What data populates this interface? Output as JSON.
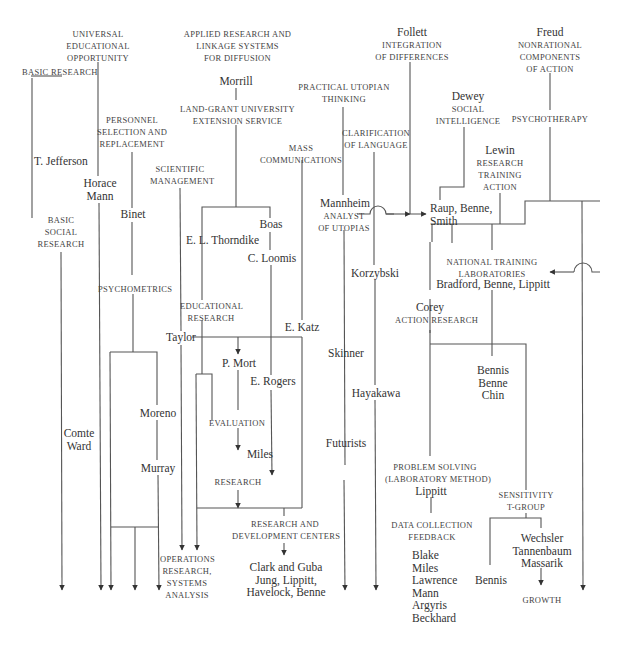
{
  "labels": {
    "universal": [
      "Universal",
      "educational",
      "opportunity"
    ],
    "basic_research": "Basic research",
    "applied": [
      "Applied research and",
      "linkage systems",
      "for diffusion"
    ],
    "morrill": "Morrill",
    "land_grant": [
      "Land-grant university",
      "extension service"
    ],
    "follett": "Follett",
    "integration": [
      "integration",
      "of differences"
    ],
    "freud": "Freud",
    "nonrational": [
      "Nonrational",
      "components",
      "of action"
    ],
    "practical_utopian": [
      "Practical utopian",
      "thinking"
    ],
    "dewey": "Dewey",
    "social_intelligence": [
      "Social",
      "intelligence"
    ],
    "psychotherapy": "Psychotherapy",
    "personnel": [
      "Personnel",
      "selection and",
      "replacement"
    ],
    "clarification": [
      "Clarification",
      "of language"
    ],
    "mass_comm": [
      "Mass",
      "communications"
    ],
    "lewin": "Lewin",
    "lewin_sub": [
      "Research",
      "training",
      "action"
    ],
    "t_jefferson": "T. Jefferson",
    "scientific_mgmt": [
      "Scientific",
      "management"
    ],
    "horace_mann": [
      "Horace",
      "Mann"
    ],
    "mannheim": "Mannheim",
    "analyst": [
      "analyst",
      "of utopias"
    ],
    "raup": [
      "Raup, Benne,",
      "Smith"
    ],
    "binet": "Binet",
    "boas": "Boas",
    "thorndike": "E. L. Thorndike",
    "basic_social": [
      "Basic",
      "social",
      "research"
    ],
    "loomis": "C. Loomis",
    "korzybski": "Korzybski",
    "ntl": [
      "National training",
      "laboratories"
    ],
    "ntl_names": "Bradford, Benne, Lippitt",
    "psychometrics": "Psychometrics",
    "educational_research": [
      "Educational",
      "research"
    ],
    "corey": "Corey",
    "action_research": "Action research",
    "taylor": "Taylor",
    "e_katz": "E. Katz",
    "skinner": "Skinner",
    "p_mort": "P. Mort",
    "e_rogers": "E. Rogers",
    "bennis_benne_chin": [
      "Bennis",
      "Benne",
      "Chin"
    ],
    "moreno": "Moreno",
    "hayakawa": "Hayakawa",
    "comte_ward": [
      "Comte",
      "Ward"
    ],
    "evaluation": "Evaluation",
    "murray": "Murray",
    "futurists": "Futurists",
    "miles": "Miles",
    "problem_solving": [
      "Problem solving",
      "(laboratory method)"
    ],
    "lippitt": "Lippitt",
    "research": "Research",
    "sensitivity": [
      "Sensitivity",
      "T-group"
    ],
    "rd_centers": [
      "Research and",
      "development centers"
    ],
    "data_collection": [
      "Data collection",
      "feedback"
    ],
    "wechsler": [
      "Wechsler",
      "Tannenbaum",
      "Massarik"
    ],
    "operations": [
      "Operations",
      "research,",
      "systems",
      "analysis"
    ],
    "clark_guba": [
      "Clark and Guba",
      "Jung, Lippitt,",
      "Havelock, Benne"
    ],
    "blake_list": [
      "Blake",
      "Miles",
      "Lawrence",
      "Mann",
      "Argyris",
      "Beckhard"
    ],
    "bennis": "Bennis",
    "growth": "Growth"
  }
}
